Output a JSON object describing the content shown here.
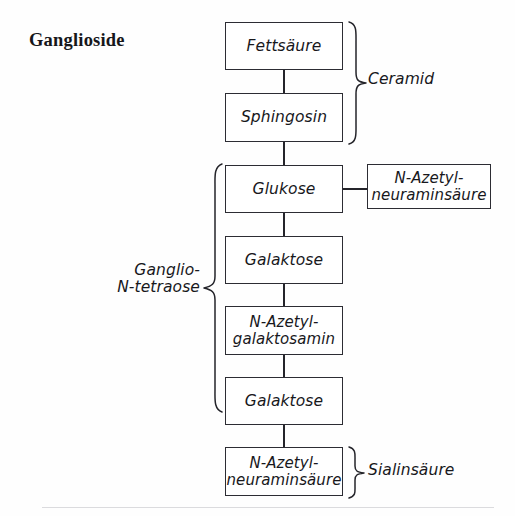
{
  "diagram": {
    "title": "Ganglioside",
    "type": "flowchart",
    "language": "de",
    "ink_color": "#24242a",
    "background_color": "#fefefe",
    "chain": [
      {
        "id": "fettsaeure",
        "label": "Fettsäure",
        "lines": [
          "Fettsäure"
        ]
      },
      {
        "id": "sphingosin",
        "label": "Sphingosin",
        "lines": [
          "Sphingosin"
        ]
      },
      {
        "id": "glukose",
        "label": "Glukose",
        "lines": [
          "Glukose"
        ]
      },
      {
        "id": "galaktose-1",
        "label": "Galaktose",
        "lines": [
          "Galaktose"
        ]
      },
      {
        "id": "n-azetyl-galaktosamin",
        "label": "N-Azetyl-galaktosamin",
        "lines": [
          "N-Azetyl-",
          "galaktosamin"
        ]
      },
      {
        "id": "galaktose-2",
        "label": "Galaktose",
        "lines": [
          "Galaktose"
        ]
      },
      {
        "id": "n-azetyl-neuraminsaeure-bottom",
        "label": "N-Azetyl-neuraminsäure",
        "lines": [
          "N-Azetyl-",
          "neuraminsäure"
        ]
      }
    ],
    "branch": {
      "id": "n-azetyl-neuraminsaeure-side",
      "label": "N-Azetyl-neuraminsäure",
      "lines": [
        "N-Azetyl-",
        "neuraminsäure"
      ],
      "attached_to": "glukose"
    },
    "group_labels": [
      {
        "id": "ceramid",
        "label": "Ceramid",
        "lines": [
          "Ceramid"
        ],
        "side": "right",
        "spans": [
          "fettsaeure",
          "sphingosin"
        ]
      },
      {
        "id": "ganglio-n-tetraose",
        "label": "Ganglio-N-tetraose",
        "lines": [
          "Ganglio-",
          "N-tetraose"
        ],
        "side": "left",
        "spans": [
          "glukose",
          "galaktose-1",
          "n-azetyl-galaktosamin",
          "galaktose-2"
        ]
      },
      {
        "id": "sialinsaeure",
        "label": "Sialinsäure",
        "lines": [
          "Sialinsäure"
        ],
        "side": "right",
        "spans": [
          "n-azetyl-neuraminsaeure-bottom"
        ]
      }
    ]
  }
}
